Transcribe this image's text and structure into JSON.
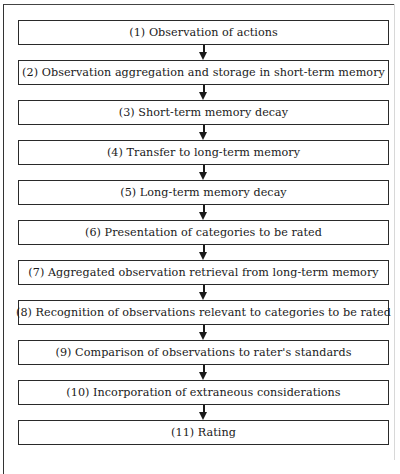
{
  "diagram": {
    "type": "flowchart",
    "direction": "top-to-bottom",
    "steps": [
      {
        "number": 1,
        "label": "(1) Observation of actions"
      },
      {
        "number": 2,
        "label": "(2) Observation aggregation and storage in short-term memory"
      },
      {
        "number": 3,
        "label": "(3) Short-term memory decay"
      },
      {
        "number": 4,
        "label": "(4) Transfer to long-term memory"
      },
      {
        "number": 5,
        "label": "(5) Long-term memory decay"
      },
      {
        "number": 6,
        "label": "(6) Presentation of categories to be rated"
      },
      {
        "number": 7,
        "label": "(7) Aggregated observation retrieval from long-term memory"
      },
      {
        "number": 8,
        "label": "(8) Recognition of observations relevant to categories to be rated"
      },
      {
        "number": 9,
        "label": "(9) Comparison of observations to rater's standards"
      },
      {
        "number": 10,
        "label": "(10) Incorporation of extraneous considerations"
      },
      {
        "number": 11,
        "label": "(11) Rating"
      }
    ],
    "edges": [
      {
        "from": 1,
        "to": 2
      },
      {
        "from": 2,
        "to": 3
      },
      {
        "from": 3,
        "to": 4
      },
      {
        "from": 4,
        "to": 5
      },
      {
        "from": 5,
        "to": 6
      },
      {
        "from": 6,
        "to": 7
      },
      {
        "from": 7,
        "to": 8
      },
      {
        "from": 8,
        "to": 9
      },
      {
        "from": 9,
        "to": 10
      },
      {
        "from": 10,
        "to": 11
      }
    ],
    "colors": {
      "box_border": "#2a2a2a",
      "text": "#1a1a1a",
      "background": "#ffffff"
    }
  }
}
